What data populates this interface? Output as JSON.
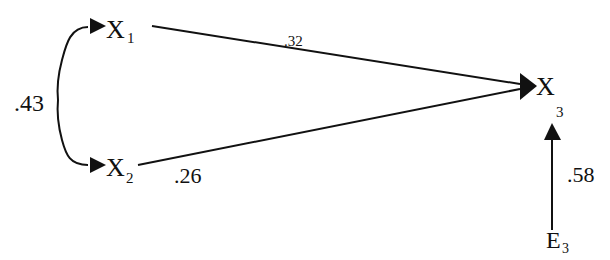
{
  "diagram": {
    "type": "path-diagram",
    "nodes": {
      "x1": {
        "label": "X",
        "sub": "1"
      },
      "x2": {
        "label": "X",
        "sub": "2"
      },
      "x3": {
        "label": "X",
        "sub": "3"
      },
      "e3": {
        "label": "E",
        "sub": "3"
      }
    },
    "edges": {
      "x1_x2_correlation": {
        "from": "X1",
        "to": "X2",
        "kind": "curved double-headed",
        "coefficient": ".43"
      },
      "x1_x3": {
        "from": "X1",
        "to": "X3",
        "kind": "directed",
        "coefficient": ".32"
      },
      "x2_x3": {
        "from": "X2",
        "to": "X3",
        "kind": "directed",
        "coefficient": ".26"
      },
      "e3_x3": {
        "from": "E3",
        "to": "X3",
        "kind": "directed",
        "coefficient": ".58"
      }
    },
    "colors": {
      "stroke": "#111111",
      "background": "#ffffff"
    }
  }
}
